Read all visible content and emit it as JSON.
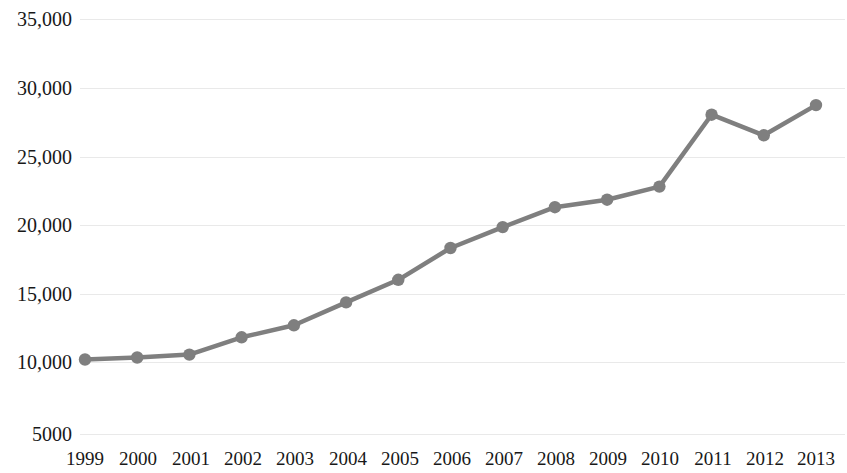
{
  "chart_data": {
    "type": "line",
    "title": "",
    "subtitle": "",
    "xlabel": "",
    "ylabel": "",
    "categories": [
      "1999",
      "2000",
      "2001",
      "2002",
      "2003",
      "2004",
      "2005",
      "2006",
      "2007",
      "2008",
      "2009",
      "2010",
      "2011",
      "2012",
      "2013"
    ],
    "values": [
      10180,
      10330,
      10540,
      11800,
      12680,
      14350,
      16000,
      18320,
      19850,
      21300,
      21850,
      22800,
      28050,
      26550,
      28750
    ],
    "series": [
      {
        "name": "",
        "values": [
          10180,
          10330,
          10540,
          11800,
          12680,
          14350,
          16000,
          18320,
          19850,
          21300,
          21850,
          22800,
          28050,
          26550,
          28750
        ]
      }
    ],
    "ylim": [
      5000,
      35000
    ],
    "ytick_values": [
      35000,
      30000,
      25000,
      20000,
      15000,
      10000,
      5000
    ],
    "ytick_labels": [
      "35,000",
      "30,000",
      "25,000",
      "20,000",
      "15,000",
      "10,000",
      "5000"
    ],
    "xtick_labels": [
      "1999",
      "2000",
      "2001",
      "2002",
      "2003",
      "2004",
      "2005",
      "2006",
      "2007",
      "2008",
      "2009",
      "2010",
      "2011",
      "2012",
      "2013"
    ],
    "grid": true,
    "grid_axis": "y",
    "legend": false,
    "legend_position": "none",
    "marker": "circle",
    "line_color": "#7f7f7f",
    "marker_color": "#7f7f7f",
    "grid_color": "#e9e9e9",
    "background_color": "#ffffff",
    "text_color": "#181818",
    "annotations": []
  }
}
